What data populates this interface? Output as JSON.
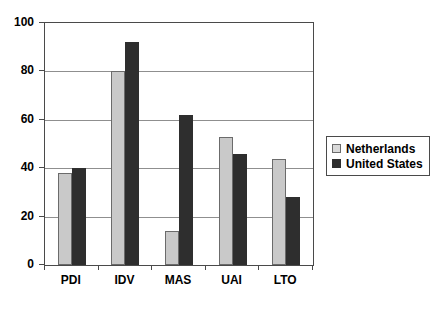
{
  "chart_data": {
    "type": "bar",
    "title": "",
    "subtitle": "",
    "xlabel": "",
    "ylabel": "",
    "categories": [
      "PDI",
      "IDV",
      "MAS",
      "UAI",
      "LTO"
    ],
    "series": [
      {
        "name": "Netherlands",
        "color": "#c9c9c9",
        "values": [
          38,
          80,
          14,
          53,
          44
        ]
      },
      {
        "name": "United States",
        "color": "#2e2e2e",
        "values": [
          40,
          92,
          62,
          46,
          28
        ]
      }
    ],
    "ylim": [
      0,
      100
    ],
    "yticks": [
      0,
      20,
      40,
      60,
      80,
      100
    ],
    "ytick_labels": [
      "0",
      "20",
      "40",
      "60",
      "80",
      "100"
    ],
    "grid": true,
    "grid_axis": "y",
    "legend_position": "right"
  },
  "legend": {
    "entries": [
      {
        "label": "Netherlands",
        "swatch": "light-gray-square"
      },
      {
        "label": "United States",
        "swatch": "dark-square"
      }
    ]
  }
}
